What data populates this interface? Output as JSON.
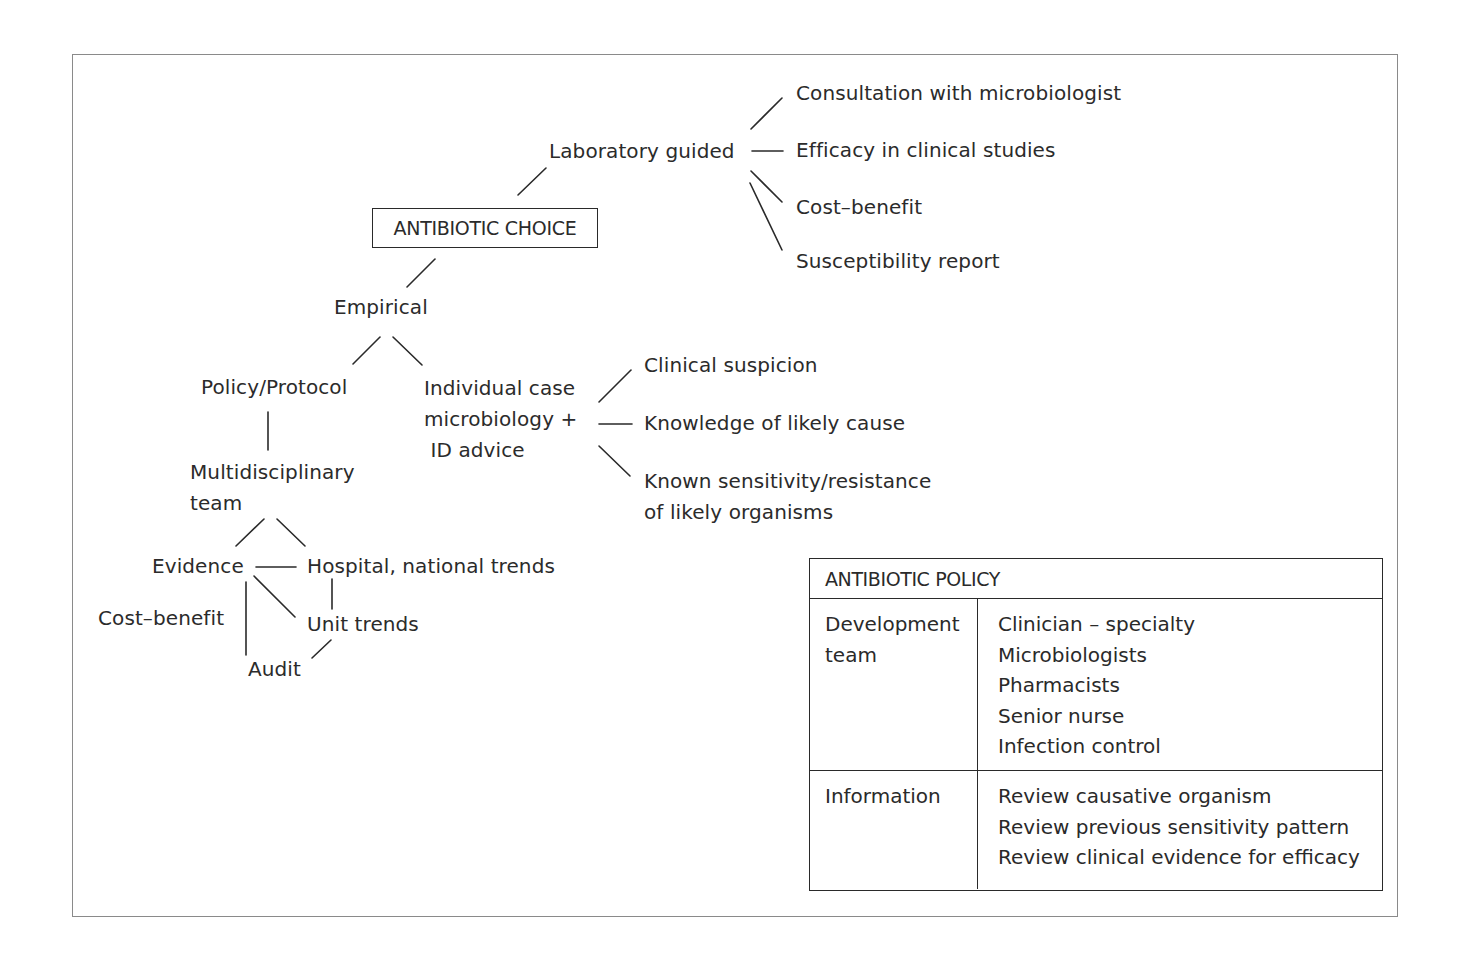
{
  "diagram": {
    "root": "ANTIBIOTIC CHOICE",
    "laboratory": {
      "label": "Laboratory guided",
      "children": [
        "Consultation with microbiologist",
        "Efficacy in clinical studies",
        "Cost–benefit",
        "Susceptibility report"
      ]
    },
    "empirical": {
      "label": "Empirical",
      "policy_protocol": {
        "label": "Policy/Protocol",
        "team": "Multidisciplinary\nteam",
        "evidence": "Evidence",
        "hospital_trends": "Hospital, national trends",
        "unit_trends": "Unit trends",
        "cost_benefit": "Cost–benefit",
        "audit": "Audit"
      },
      "individual_case": {
        "label": "Individual case\nmicrobiology +\n ID advice",
        "children": [
          "Clinical suspicion",
          "Knowledge of likely cause",
          "Known sensitivity/resistance\nof likely organisms"
        ]
      }
    }
  },
  "policy_table": {
    "title": "ANTIBIOTIC POLICY",
    "rows": [
      {
        "key": "Development\nteam",
        "values": [
          "Clinician – specialty",
          "Microbiologists",
          "Pharmacists",
          "Senior nurse",
          "Infection control"
        ]
      },
      {
        "key": "Information",
        "values": [
          "Review causative organism",
          "Review previous sensitivity pattern",
          "Review clinical evidence for efficacy"
        ]
      }
    ]
  }
}
